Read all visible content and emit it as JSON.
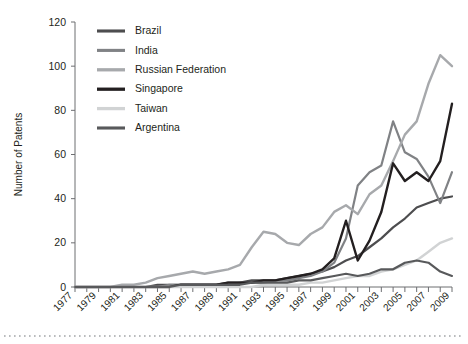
{
  "figure": {
    "background": "#ffffff",
    "axis_color": "#6d6e71",
    "text_color": "#231f20",
    "rule_color": "#b9bbbd"
  },
  "chart_data": {
    "type": "line",
    "title": "",
    "xlabel": "",
    "ylabel": "Number of Patents",
    "xlim": [
      1977,
      2009
    ],
    "ylim": [
      0,
      120
    ],
    "yticks": [
      0,
      20,
      40,
      60,
      80,
      100,
      120
    ],
    "grid": false,
    "legend_position": "top-center",
    "x": [
      1977,
      1978,
      1979,
      1980,
      1981,
      1982,
      1983,
      1984,
      1985,
      1986,
      1987,
      1988,
      1989,
      1990,
      1991,
      1992,
      1993,
      1994,
      1995,
      1996,
      1997,
      1998,
      1999,
      2000,
      2001,
      2002,
      2003,
      2004,
      2005,
      2006,
      2007,
      2008,
      2009
    ],
    "xtick_labels": [
      "1977",
      "1979",
      "1981",
      "1983",
      "1985",
      "1987",
      "1989",
      "1991",
      "1993",
      "1995",
      "1997",
      "1999",
      "2001",
      "2003",
      "2005",
      "2007",
      "2009"
    ],
    "series": [
      {
        "name": "Brazil",
        "color": "#4d4d4f",
        "width": 2.2,
        "values": [
          0,
          0,
          0,
          0,
          0,
          0,
          0,
          1,
          1,
          1,
          1,
          1,
          1,
          2,
          2,
          3,
          3,
          3,
          4,
          5,
          6,
          7,
          9,
          12,
          14,
          18,
          22,
          27,
          31,
          36,
          38,
          40,
          41
        ]
      },
      {
        "name": "India",
        "color": "#808285",
        "width": 2.2,
        "values": [
          0,
          0,
          0,
          0,
          0,
          0,
          0,
          0,
          1,
          1,
          1,
          1,
          1,
          1,
          2,
          2,
          2,
          3,
          3,
          4,
          5,
          7,
          11,
          22,
          46,
          52,
          55,
          75,
          61,
          58,
          50,
          38,
          52
        ]
      },
      {
        "name": "Russian Federation",
        "color": "#a7a9ac",
        "width": 2.4,
        "values": [
          0,
          0,
          0,
          0,
          1,
          1,
          2,
          4,
          5,
          6,
          7,
          6,
          7,
          8,
          10,
          18,
          25,
          24,
          20,
          19,
          24,
          27,
          34,
          37,
          33,
          42,
          46,
          57,
          69,
          75,
          92,
          105,
          100
        ]
      },
      {
        "name": "Singapore",
        "color": "#231f20",
        "width": 2.4,
        "values": [
          0,
          0,
          0,
          0,
          0,
          0,
          0,
          0,
          0,
          1,
          1,
          1,
          1,
          2,
          2,
          2,
          3,
          3,
          4,
          5,
          6,
          8,
          13,
          30,
          12,
          21,
          34,
          56,
          48,
          52,
          48,
          57,
          83
        ]
      },
      {
        "name": "Taiwan",
        "color": "#d1d3d4",
        "width": 2.4,
        "values": [
          0,
          0,
          0,
          0,
          0,
          0,
          0,
          0,
          0,
          0,
          0,
          0,
          0,
          0,
          0,
          0,
          1,
          1,
          1,
          1,
          2,
          2,
          3,
          4,
          5,
          5,
          7,
          8,
          10,
          12,
          16,
          20,
          22
        ]
      },
      {
        "name": "Argentina",
        "color": "#58595b",
        "width": 2.2,
        "values": [
          0,
          0,
          0,
          0,
          0,
          0,
          0,
          0,
          0,
          1,
          1,
          1,
          1,
          1,
          1,
          2,
          2,
          2,
          2,
          3,
          3,
          4,
          5,
          6,
          5,
          6,
          8,
          8,
          11,
          12,
          11,
          7,
          5
        ]
      }
    ]
  }
}
